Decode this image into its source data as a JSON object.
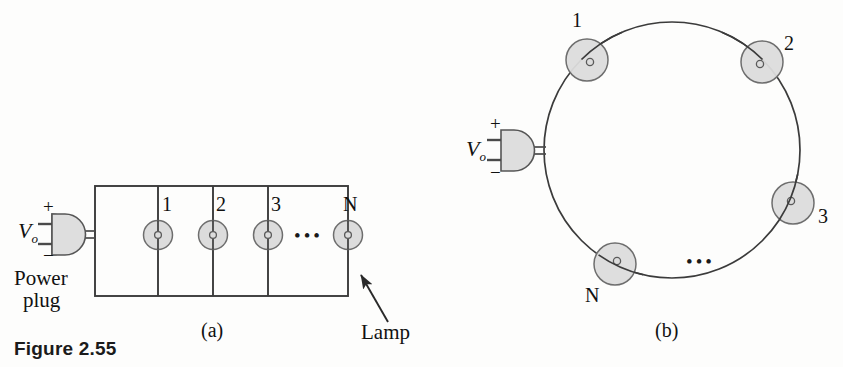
{
  "figure": {
    "caption": "Figure 2.55",
    "panels": [
      {
        "id": "a",
        "label": "(a)",
        "type": "parallel-lamp-circuit"
      },
      {
        "id": "b",
        "label": "(b)",
        "type": "series-ring-lamp-circuit"
      }
    ]
  },
  "panel_a": {
    "label": "(a)",
    "source": {
      "voltage_label": "V",
      "voltage_subscript": "o",
      "plus_sign": "+",
      "minus_sign": "−",
      "plug_label_line1": "Power",
      "plug_label_line2": "plug"
    },
    "lamps": [
      {
        "label": "1"
      },
      {
        "label": "2"
      },
      {
        "label": "3"
      },
      {
        "label": "N"
      }
    ],
    "ellipsis": "•••",
    "annotation": {
      "text": "Lamp",
      "target": "lamp-N"
    }
  },
  "panel_b": {
    "label": "(b)",
    "source": {
      "voltage_label": "V",
      "voltage_subscript": "o",
      "plus_sign": "+",
      "minus_sign": "−"
    },
    "lamps": [
      {
        "label": "1"
      },
      {
        "label": "2"
      },
      {
        "label": "3"
      },
      {
        "label": "N"
      }
    ],
    "ellipsis": "•••"
  },
  "colors": {
    "background": "#fdfdfc",
    "stroke": "#3b3b3b",
    "lamp_fill": "#dcdcdc",
    "lamp_stroke": "#6e6e6e",
    "plug_fill": "#dedede",
    "text": "#111111"
  }
}
